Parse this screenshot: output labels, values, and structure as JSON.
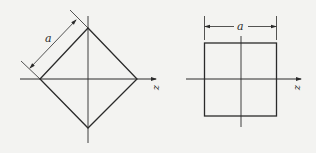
{
  "figure": {
    "colors": {
      "background": "#f3f3f1",
      "stroke": "#2a2a2a"
    },
    "left_panel": {
      "description": "Square rotated 45 degrees (diamond) centered on axes",
      "shape": "diamond",
      "dimension_label": "a",
      "axis_label": "z"
    },
    "right_panel": {
      "description": "Axis-aligned square centered on axes",
      "shape": "square",
      "dimension_label": "a",
      "axis_label": "z"
    }
  }
}
